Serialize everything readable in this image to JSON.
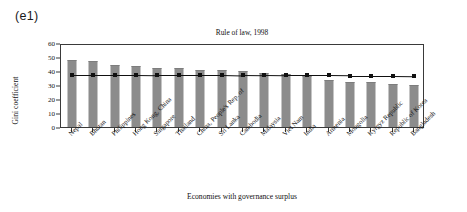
{
  "panel": {
    "tag": "(e1)"
  },
  "axis": {
    "y_label": "Gini coefficient",
    "x_label": "Economies with governance surplus",
    "y_ticks": [
      "0",
      "10",
      "20",
      "30",
      "40",
      "50",
      "60"
    ]
  },
  "chart_data": {
    "type": "bar",
    "title": "Rule of law, 1998",
    "xlabel": "Economies with governance surplus",
    "ylabel": "Gini coefficient",
    "ylim": [
      0,
      60
    ],
    "ytick_step": 10,
    "grid": false,
    "legend": "none",
    "categories": [
      "Nepal",
      "Bhutan",
      "Philippines",
      "Hong Kong, China",
      "Singapore",
      "Thailand",
      "China, People's Rep. of",
      "Sri Lanka",
      "Cambodia",
      "Malaysia",
      "Viet Nam",
      "India",
      "Armenia",
      "Mongolia",
      "Kyrgyz Republic",
      "Republic of Korea",
      "Bangladesh"
    ],
    "series": [
      {
        "name": "Gini coefficient",
        "type": "bar",
        "color": "#8c8c8c",
        "values": [
          47.0,
          46.5,
          43.6,
          42.8,
          41.7,
          41.5,
          39.8,
          40.3,
          39.4,
          38.0,
          36.8,
          35.9,
          33.0,
          31.7,
          31.6,
          30.3,
          29.4
        ]
      },
      {
        "name": "Reference line",
        "type": "line",
        "color": "#111111",
        "marker": "square",
        "values": [
          38.9,
          38.9,
          38.9,
          38.9,
          38.8,
          38.8,
          38.8,
          38.8,
          38.5,
          38.4,
          38.3,
          38.3,
          38.3,
          38.2,
          38.2,
          38.2,
          38.1
        ]
      }
    ]
  }
}
